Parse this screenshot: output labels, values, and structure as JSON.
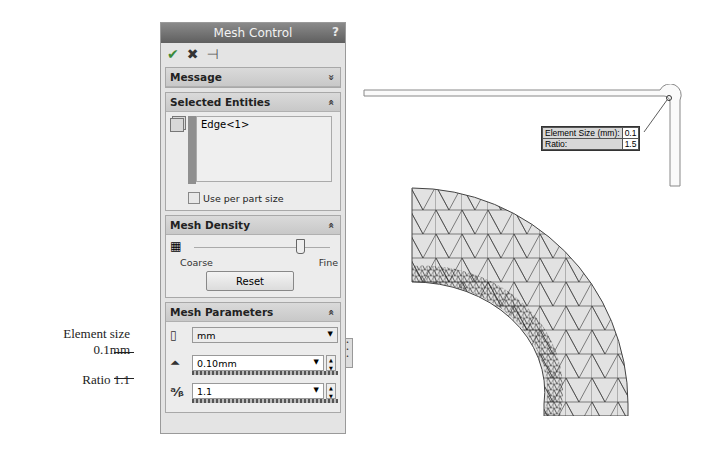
{
  "panel": {
    "title": "Mesh Control",
    "help": "?",
    "commands": {
      "ok": "✔",
      "cancel": "✖",
      "pin": "⊣"
    },
    "sections": {
      "message": {
        "title": "Message",
        "chevron": "»"
      },
      "selected": {
        "title": "Selected Entities",
        "chevron": "«",
        "entities": [
          "Edge<1>"
        ],
        "checkbox_label": "Use per part size"
      },
      "density": {
        "title": "Mesh Density",
        "chevron": "«",
        "coarse": "Coarse",
        "fine": "Fine",
        "reset": "Reset"
      },
      "params": {
        "title": "Mesh Parameters",
        "chevron": "«",
        "unit": "mm",
        "element_size": "0.10mm",
        "ratio": "1.1"
      }
    }
  },
  "annotations": {
    "element_size_line1": "Element size",
    "element_size_line2": "0.1mm",
    "ratio": "Ratio 1.1"
  },
  "callout": {
    "size_label": "Element Size (mm):",
    "size_value": "0.1",
    "ratio_label": "Ratio:",
    "ratio_value": "1.5"
  }
}
